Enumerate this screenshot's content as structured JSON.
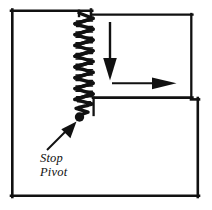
{
  "figure": {
    "name": "stop-pivot-mechanism-diagram",
    "type": "line-diagram",
    "background_color": "#ffffff",
    "stroke_color": "#111111",
    "labels": {
      "stop": "Stop",
      "pivot": "Pivot"
    },
    "icons": {
      "spring": "spring-coil-icon",
      "pivot_dot": "pivot-dot-icon",
      "down_arrow": "down-arrow-icon",
      "right-arrow": "right-arrow-icon",
      "callout_arrow": "callout-arrow-icon"
    },
    "geometry": {
      "outer_frame": {
        "x": 11,
        "y": 9,
        "width": 188,
        "height": 189,
        "stroke_width": 2.6
      },
      "upper_left_block": {
        "x": 11,
        "y": 9,
        "right": 91,
        "bottom": 198
      },
      "upper_right_block": {
        "x": 93,
        "y": 14,
        "right": 192,
        "bottom": 98
      },
      "lower_right_block": {
        "x": 93,
        "y": 98,
        "right": 199,
        "bottom": 198
      },
      "spring": {
        "x_left": 73,
        "x_right": 95,
        "y_top": 14,
        "y_bottom": 113,
        "coils": 22
      },
      "pivot_dot": {
        "cx": 80,
        "cy": 117,
        "r": 4.6
      },
      "down_arrow": {
        "x": 110,
        "y_start": 22,
        "y_end": 79
      },
      "right_arrow": {
        "y": 83,
        "x_start": 112,
        "x_end": 176
      },
      "callout_arrow": {
        "x_start": 47,
        "y_start": 149,
        "x_end": 74,
        "y_end": 122
      },
      "text_block": {
        "x": 40,
        "y_stop": 161,
        "y_pivot": 175
      }
    }
  }
}
